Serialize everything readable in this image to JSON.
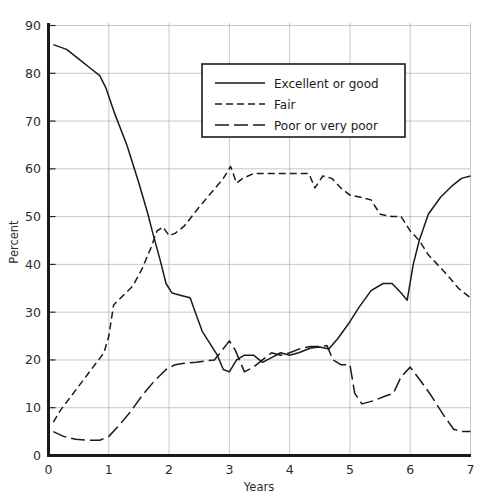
{
  "figure": {
    "cropped_header_text": "",
    "background": "#ffffff",
    "ink": "#1a1a1a",
    "grid_color": "#b9b9b9"
  },
  "axes": {
    "y_title": "Percent",
    "x_title": "Years",
    "y_ticks": [
      "0",
      "10",
      "20",
      "30",
      "40",
      "50",
      "60",
      "70",
      "80",
      "90"
    ],
    "x_ticks": [
      "0",
      "1",
      "2",
      "3",
      "4",
      "5",
      "6",
      "7"
    ],
    "x_origin_label": "0"
  },
  "legend": {
    "items": [
      {
        "label": "Excellent or good",
        "style": "solid"
      },
      {
        "label": "Fair",
        "style": "dashed"
      },
      {
        "label": "Poor or very poor",
        "style": "longdash"
      }
    ]
  },
  "chart_data": {
    "type": "line",
    "title": "",
    "xlabel": "Years",
    "ylabel": "Percent",
    "xlim": [
      0,
      7
    ],
    "ylim": [
      0,
      90
    ],
    "xticks": [
      0,
      1,
      2,
      3,
      4,
      5,
      6,
      7
    ],
    "yticks": [
      0,
      10,
      20,
      30,
      40,
      50,
      60,
      70,
      80,
      90
    ],
    "grid": true,
    "legend_position": "upper-center",
    "series": [
      {
        "name": "Excellent or good",
        "style": "solid",
        "points": [
          [
            0.08,
            86.0
          ],
          [
            0.3,
            85.0
          ],
          [
            0.5,
            83.0
          ],
          [
            0.7,
            81.0
          ],
          [
            0.85,
            79.5
          ],
          [
            0.95,
            77.0
          ],
          [
            1.1,
            71.5
          ],
          [
            1.3,
            65.0
          ],
          [
            1.5,
            57.0
          ],
          [
            1.65,
            50.5
          ],
          [
            1.72,
            47.0
          ],
          [
            1.85,
            41.0
          ],
          [
            1.95,
            36.0
          ],
          [
            2.05,
            34.0
          ],
          [
            2.2,
            33.5
          ],
          [
            2.35,
            33.0
          ],
          [
            2.42,
            30.5
          ],
          [
            2.55,
            26.0
          ],
          [
            2.7,
            23.0
          ],
          [
            2.8,
            21.0
          ],
          [
            2.9,
            18.0
          ],
          [
            3.0,
            17.5
          ],
          [
            3.12,
            20.0
          ],
          [
            3.25,
            21.0
          ],
          [
            3.4,
            21.0
          ],
          [
            3.55,
            19.5
          ],
          [
            3.7,
            20.5
          ],
          [
            3.85,
            21.5
          ],
          [
            4.0,
            21.0
          ],
          [
            4.15,
            21.5
          ],
          [
            4.35,
            22.5
          ],
          [
            4.5,
            22.7
          ],
          [
            4.65,
            22.3
          ],
          [
            4.8,
            24.5
          ],
          [
            5.0,
            28.0
          ],
          [
            5.15,
            31.0
          ],
          [
            5.35,
            34.5
          ],
          [
            5.55,
            36.0
          ],
          [
            5.7,
            36.0
          ],
          [
            5.85,
            34.0
          ],
          [
            5.95,
            32.5
          ],
          [
            6.05,
            40.0
          ],
          [
            6.15,
            45.0
          ],
          [
            6.3,
            50.5
          ],
          [
            6.5,
            54.0
          ],
          [
            6.7,
            56.5
          ],
          [
            6.85,
            58.0
          ],
          [
            7.0,
            58.5
          ]
        ]
      },
      {
        "name": "Fair",
        "style": "dashed",
        "points": [
          [
            0.08,
            7.0
          ],
          [
            0.2,
            9.5
          ],
          [
            0.35,
            12.0
          ],
          [
            0.5,
            14.5
          ],
          [
            0.65,
            17.0
          ],
          [
            0.8,
            19.5
          ],
          [
            0.92,
            21.5
          ],
          [
            1.0,
            25.0
          ],
          [
            1.08,
            31.5
          ],
          [
            1.2,
            33.0
          ],
          [
            1.4,
            35.5
          ],
          [
            1.55,
            39.0
          ],
          [
            1.7,
            43.5
          ],
          [
            1.8,
            47.0
          ],
          [
            1.9,
            47.8
          ],
          [
            2.0,
            46.0
          ],
          [
            2.1,
            46.5
          ],
          [
            2.25,
            48.0
          ],
          [
            2.5,
            52.0
          ],
          [
            2.7,
            55.0
          ],
          [
            2.9,
            58.0
          ],
          [
            3.02,
            60.5
          ],
          [
            3.12,
            57.0
          ],
          [
            3.22,
            58.0
          ],
          [
            3.4,
            59.0
          ],
          [
            3.7,
            59.0
          ],
          [
            4.0,
            59.0
          ],
          [
            4.2,
            59.0
          ],
          [
            4.32,
            59.0
          ],
          [
            4.42,
            56.0
          ],
          [
            4.55,
            58.5
          ],
          [
            4.7,
            58.0
          ],
          [
            4.85,
            56.0
          ],
          [
            5.0,
            54.5
          ],
          [
            5.2,
            54.0
          ],
          [
            5.35,
            53.5
          ],
          [
            5.5,
            50.5
          ],
          [
            5.7,
            50.0
          ],
          [
            5.85,
            50.0
          ],
          [
            6.0,
            47.0
          ],
          [
            6.15,
            45.0
          ],
          [
            6.3,
            42.0
          ],
          [
            6.45,
            40.0
          ],
          [
            6.6,
            38.0
          ],
          [
            6.8,
            35.0
          ],
          [
            7.0,
            33.0
          ]
        ]
      },
      {
        "name": "Poor or very poor",
        "style": "longdash",
        "points": [
          [
            0.08,
            5.0
          ],
          [
            0.25,
            4.0
          ],
          [
            0.45,
            3.4
          ],
          [
            0.65,
            3.2
          ],
          [
            0.85,
            3.2
          ],
          [
            1.0,
            4.0
          ],
          [
            1.15,
            6.0
          ],
          [
            1.35,
            9.0
          ],
          [
            1.55,
            12.5
          ],
          [
            1.75,
            15.5
          ],
          [
            1.95,
            18.0
          ],
          [
            2.1,
            19.0
          ],
          [
            2.25,
            19.3
          ],
          [
            2.45,
            19.5
          ],
          [
            2.6,
            19.8
          ],
          [
            2.75,
            20.0
          ],
          [
            2.85,
            21.5
          ],
          [
            3.0,
            24.0
          ],
          [
            3.1,
            22.0
          ],
          [
            3.25,
            17.5
          ],
          [
            3.4,
            18.5
          ],
          [
            3.55,
            20.0
          ],
          [
            3.7,
            21.5
          ],
          [
            3.85,
            21.0
          ],
          [
            4.0,
            21.5
          ],
          [
            4.2,
            22.5
          ],
          [
            4.35,
            22.8
          ],
          [
            4.5,
            22.8
          ],
          [
            4.62,
            23.0
          ],
          [
            4.72,
            20.0
          ],
          [
            4.85,
            19.0
          ],
          [
            5.0,
            19.0
          ],
          [
            5.08,
            13.0
          ],
          [
            5.2,
            10.8
          ],
          [
            5.4,
            11.5
          ],
          [
            5.6,
            12.5
          ],
          [
            5.72,
            13.0
          ],
          [
            5.85,
            16.5
          ],
          [
            6.0,
            18.5
          ],
          [
            6.15,
            16.0
          ],
          [
            6.35,
            12.5
          ],
          [
            6.55,
            8.5
          ],
          [
            6.72,
            5.5
          ],
          [
            6.85,
            5.0
          ],
          [
            7.0,
            5.0
          ]
        ]
      }
    ]
  }
}
